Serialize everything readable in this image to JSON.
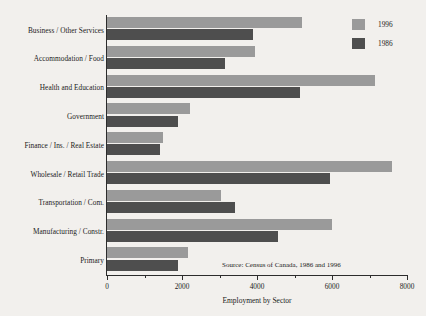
{
  "chart_data": {
    "type": "bar",
    "orientation": "horizontal",
    "title": "",
    "xlabel": "Employment by Sector",
    "ylabel": "",
    "xlim": [
      0,
      8000
    ],
    "xticks": [
      0,
      2000,
      4000,
      6000,
      8000
    ],
    "xtick_labels": [
      "0",
      "2000",
      "4000",
      "6000",
      "8000"
    ],
    "minor_ticks": [
      1000,
      3000,
      5000,
      7000
    ],
    "grid": false,
    "legend_position": "top-right",
    "categories": [
      "Business / Other Services",
      "Accommodation / Food",
      "Health and Education",
      "Government",
      "Finance / Ins. / Real Estate",
      "Wholesale / Retail Trade",
      "Transportation / Com.",
      "Manufacturing / Constr.",
      "Primary"
    ],
    "series": [
      {
        "name": "1996",
        "color": "#9a9a9a",
        "values": [
          5200,
          3950,
          7150,
          2200,
          1500,
          7600,
          3050,
          6000,
          2150
        ]
      },
      {
        "name": "1986",
        "color": "#4e4e4e",
        "values": [
          3900,
          3150,
          5150,
          1900,
          1400,
          5950,
          3400,
          4550,
          1900
        ]
      }
    ],
    "annotations": [
      "Source:  Census of Canada, 1986 and 1996"
    ]
  },
  "legend": {
    "items": [
      {
        "label": "1996",
        "color": "#9a9a9a"
      },
      {
        "label": "1986",
        "color": "#4e4e4e"
      }
    ]
  },
  "source_note": "Source:  Census of Canada, 1986 and 1996",
  "axis": {
    "x_title": "Employment by Sector"
  },
  "colors": {
    "background": "#f2f0ed",
    "axis": "#2c2c2c",
    "text": "#1b1b1b",
    "series_1996": "#9a9a9a",
    "series_1986": "#4e4e4e"
  }
}
